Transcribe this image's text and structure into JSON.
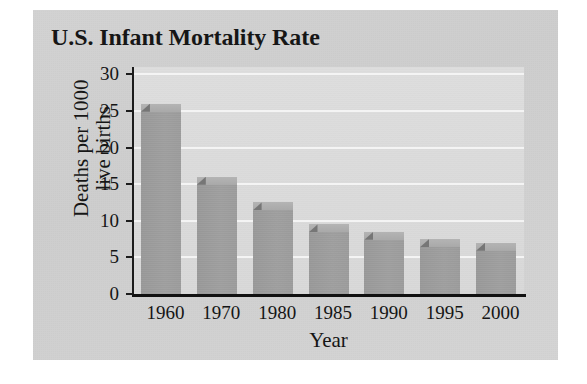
{
  "chart_data": {
    "type": "bar",
    "title": "U.S. Infant Mortality Rate",
    "xlabel": "Year",
    "ylabel_lines": [
      "Deaths per 1000",
      "live births"
    ],
    "ylabel": "Deaths per 1000 live births",
    "categories": [
      "1960",
      "1970",
      "1980",
      "1985",
      "1990",
      "1995",
      "2000"
    ],
    "values": [
      26,
      16,
      12.5,
      9.5,
      8.5,
      7.5,
      7
    ],
    "ylim": [
      0,
      31
    ],
    "yticks": [
      0,
      5,
      10,
      15,
      20,
      25,
      30
    ],
    "ytick_labels": [
      "0",
      "5",
      "10",
      "15",
      "20",
      "25",
      "30"
    ],
    "grid": "horizontal",
    "legend": "none",
    "series": [
      {
        "name": "Deaths per 1000 live births",
        "values": [
          26,
          16,
          12.5,
          9.5,
          8.5,
          7.5,
          7
        ]
      }
    ]
  },
  "colors": {
    "card_background": "#d2d2d2",
    "plot_background": "#dcdcdc",
    "gridline": "#f4f4f4",
    "bar_front": "#9e9e9e",
    "bar_side": "#7f7f7f",
    "bar_top": "#b0b0b0",
    "axis": "#151515",
    "text": "#161616"
  }
}
